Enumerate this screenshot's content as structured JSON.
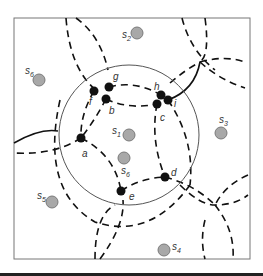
{
  "diagram": {
    "frame": {
      "x": 14,
      "y": 18,
      "w": 236,
      "h": 241,
      "stroke": "#777777"
    },
    "big_circle": {
      "cx": 129,
      "cy": 135,
      "r": 70,
      "stroke": "#555555"
    },
    "sensors": [
      {
        "id": "s1",
        "label": "s",
        "sub": "1",
        "x": 129,
        "y": 135,
        "lx": 112,
        "ly": 134
      },
      {
        "id": "s2",
        "label": "s",
        "sub": "2",
        "x": 137,
        "y": 33,
        "lx": 122,
        "ly": 38
      },
      {
        "id": "s3",
        "label": "s",
        "sub": "3",
        "x": 221,
        "y": 133,
        "lx": 219,
        "ly": 123
      },
      {
        "id": "s4",
        "label": "s",
        "sub": "4",
        "x": 164,
        "y": 250,
        "lx": 172,
        "ly": 250
      },
      {
        "id": "s5",
        "label": "s",
        "sub": "5",
        "x": 52,
        "y": 202,
        "lx": 37,
        "ly": 199
      },
      {
        "id": "s6",
        "label": "s",
        "sub": "6",
        "x": 39,
        "y": 80,
        "lx": 25,
        "ly": 74
      },
      {
        "id": "s6b",
        "label": "s",
        "sub": "6",
        "x": 124,
        "y": 158,
        "lx": 121,
        "ly": 174
      }
    ],
    "nodes": [
      {
        "id": "a",
        "label": "a",
        "x": 81,
        "y": 138,
        "lx": 82,
        "ly": 157
      },
      {
        "id": "b",
        "label": "b",
        "x": 106,
        "y": 99,
        "lx": 109,
        "ly": 114
      },
      {
        "id": "c",
        "label": "c",
        "x": 157,
        "y": 104,
        "lx": 160,
        "ly": 121
      },
      {
        "id": "d",
        "label": "d",
        "x": 165,
        "y": 177,
        "lx": 171,
        "ly": 176
      },
      {
        "id": "e",
        "label": "e",
        "x": 121,
        "y": 191,
        "lx": 129,
        "ly": 200
      },
      {
        "id": "f",
        "label": "f",
        "x": 94,
        "y": 91,
        "lx": 89,
        "ly": 105
      },
      {
        "id": "g",
        "label": "g",
        "x": 109,
        "y": 87,
        "lx": 113,
        "ly": 80
      },
      {
        "id": "h",
        "label": "h",
        "x": 161,
        "y": 95,
        "lx": 154,
        "ly": 90
      },
      {
        "id": "i",
        "label": "i",
        "x": 168,
        "y": 100,
        "lx": 174,
        "ly": 107
      }
    ],
    "colors": {
      "node": "#111111",
      "sensor_fill": "#a8a8a8",
      "sensor_stroke": "#7a7a7a",
      "dash": "#111111"
    }
  }
}
